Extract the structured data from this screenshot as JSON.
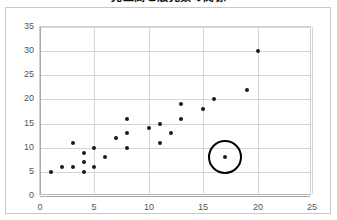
{
  "chart_data": {
    "type": "scatter",
    "title": "売上高と販売数の関係",
    "xlabel": "",
    "ylabel": "",
    "xlim": [
      0,
      25
    ],
    "ylim": [
      0,
      35
    ],
    "xticks": [
      "0",
      "5",
      "10",
      "15",
      "20",
      "25"
    ],
    "yticks": [
      "0",
      "5",
      "10",
      "15",
      "20",
      "25",
      "30",
      "35"
    ],
    "xtick_values": [
      0,
      5,
      10,
      15,
      20,
      25
    ],
    "ytick_values": [
      0,
      5,
      10,
      15,
      20,
      25,
      30,
      35
    ],
    "grid": true,
    "legend": "none",
    "marker_color": "#1a1a1a",
    "gridline_color": "#d6d6d6",
    "background_color": "#ffffff",
    "points": [
      {
        "x": 1,
        "y": 5
      },
      {
        "x": 2,
        "y": 6
      },
      {
        "x": 3,
        "y": 6
      },
      {
        "x": 3,
        "y": 11
      },
      {
        "x": 4,
        "y": 5
      },
      {
        "x": 4,
        "y": 7
      },
      {
        "x": 4,
        "y": 9
      },
      {
        "x": 5,
        "y": 6
      },
      {
        "x": 5,
        "y": 10
      },
      {
        "x": 6,
        "y": 8
      },
      {
        "x": 7,
        "y": 12
      },
      {
        "x": 8,
        "y": 10
      },
      {
        "x": 8,
        "y": 13
      },
      {
        "x": 8,
        "y": 16
      },
      {
        "x": 10,
        "y": 14
      },
      {
        "x": 11,
        "y": 11
      },
      {
        "x": 11,
        "y": 15
      },
      {
        "x": 12,
        "y": 13
      },
      {
        "x": 13,
        "y": 16
      },
      {
        "x": 13,
        "y": 19
      },
      {
        "x": 15,
        "y": 18
      },
      {
        "x": 16,
        "y": 20
      },
      {
        "x": 17,
        "y": 8
      },
      {
        "x": 19,
        "y": 22
      },
      {
        "x": 20,
        "y": 30
      }
    ],
    "annotations": [
      {
        "kind": "circle-highlight",
        "x": 17,
        "y": 8,
        "radius_px": 17,
        "color": "#000000",
        "label": "outlier-highlight"
      }
    ]
  }
}
